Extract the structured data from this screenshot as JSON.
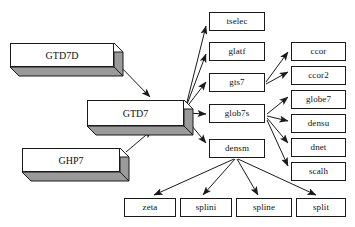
{
  "diagram": {
    "type": "flowchart",
    "background_color": "#ffffff",
    "box_fill_color": "#ffffff",
    "box_border_color": "#1a1a1a",
    "block_shade_color": "#9a9a9a",
    "arrow_color": "#1a1a1a"
  },
  "blocks": [
    {
      "id": "gtd7d",
      "label": "GTD7D",
      "x": 10,
      "y": 43,
      "w": 104,
      "h": 24,
      "depth": 9
    },
    {
      "id": "gtd7",
      "label": "GTD7",
      "x": 87,
      "y": 100,
      "w": 97,
      "h": 26,
      "depth": 9
    },
    {
      "id": "ghp7",
      "label": "GHP7",
      "x": 22,
      "y": 148,
      "w": 98,
      "h": 24,
      "depth": 9
    }
  ],
  "nodes": [
    {
      "id": "tselec",
      "label": "tselec",
      "x": 209,
      "y": 12,
      "w": 56,
      "h": 19
    },
    {
      "id": "glatf",
      "label": "glatf",
      "x": 209,
      "y": 42,
      "w": 56,
      "h": 19
    },
    {
      "id": "gts7",
      "label": "gts7",
      "x": 209,
      "y": 73,
      "w": 56,
      "h": 19
    },
    {
      "id": "glob7s",
      "label": "glob7s",
      "x": 209,
      "y": 104,
      "w": 56,
      "h": 19
    },
    {
      "id": "densm",
      "label": "densm",
      "x": 209,
      "y": 139,
      "w": 56,
      "h": 19
    },
    {
      "id": "ccor",
      "label": "ccor",
      "x": 291,
      "y": 42,
      "w": 55,
      "h": 19
    },
    {
      "id": "ccor2",
      "label": "ccor2",
      "x": 291,
      "y": 66,
      "w": 55,
      "h": 19
    },
    {
      "id": "globe7",
      "label": "globe7",
      "x": 291,
      "y": 90,
      "w": 55,
      "h": 19
    },
    {
      "id": "densu",
      "label": "densu",
      "x": 291,
      "y": 114,
      "w": 55,
      "h": 19
    },
    {
      "id": "dnet",
      "label": "dnet",
      "x": 291,
      "y": 138,
      "w": 55,
      "h": 19
    },
    {
      "id": "scalh",
      "label": "scalh",
      "x": 291,
      "y": 162,
      "w": 55,
      "h": 19
    },
    {
      "id": "zeta",
      "label": "zeta",
      "x": 124,
      "y": 198,
      "w": 52,
      "h": 19
    },
    {
      "id": "splini",
      "label": "splini",
      "x": 180,
      "y": 198,
      "w": 52,
      "h": 19
    },
    {
      "id": "spline",
      "label": "spline",
      "x": 236,
      "y": 198,
      "w": 56,
      "h": 19
    },
    {
      "id": "split",
      "label": "split",
      "x": 296,
      "y": 198,
      "w": 50,
      "h": 19
    }
  ],
  "edges": [
    {
      "from": "gtd7d",
      "to": "gtd7",
      "x1": 118,
      "y1": 64,
      "x2": 150,
      "y2": 97
    },
    {
      "from": "ghp7",
      "to": "gtd7",
      "x1": 126,
      "y1": 152,
      "x2": 152,
      "y2": 130
    },
    {
      "from": "gtd7",
      "to": "tselec",
      "x1": 186,
      "y1": 106,
      "x2": 206,
      "y2": 26
    },
    {
      "from": "gtd7",
      "to": "glatf",
      "x1": 186,
      "y1": 107,
      "x2": 206,
      "y2": 54
    },
    {
      "from": "gtd7",
      "to": "gts7",
      "x1": 186,
      "y1": 108,
      "x2": 206,
      "y2": 82
    },
    {
      "from": "gtd7",
      "to": "glob7s",
      "x1": 187,
      "y1": 113,
      "x2": 206,
      "y2": 114
    },
    {
      "from": "gtd7",
      "to": "densm",
      "x1": 187,
      "y1": 120,
      "x2": 206,
      "y2": 143
    },
    {
      "from": "gts7",
      "to": "ccor",
      "x1": 266,
      "y1": 82,
      "x2": 288,
      "y2": 52
    },
    {
      "from": "gts7",
      "to": "ccor2",
      "x1": 266,
      "y1": 84,
      "x2": 288,
      "y2": 72
    },
    {
      "from": "glob7s",
      "to": "globe7",
      "x1": 267,
      "y1": 114,
      "x2": 288,
      "y2": 97
    },
    {
      "from": "glob7s",
      "to": "densu",
      "x1": 267,
      "y1": 116,
      "x2": 288,
      "y2": 121
    },
    {
      "from": "glob7s",
      "to": "dnet",
      "x1": 267,
      "y1": 118,
      "x2": 288,
      "y2": 143
    },
    {
      "from": "glob7s",
      "to": "scalh",
      "x1": 267,
      "y1": 120,
      "x2": 288,
      "y2": 166
    },
    {
      "from": "densm",
      "to": "zeta",
      "x1": 234,
      "y1": 159,
      "x2": 154,
      "y2": 195
    },
    {
      "from": "densm",
      "to": "splini",
      "x1": 235,
      "y1": 159,
      "x2": 203,
      "y2": 195
    },
    {
      "from": "densm",
      "to": "spline",
      "x1": 237,
      "y1": 159,
      "x2": 258,
      "y2": 195
    },
    {
      "from": "densm",
      "to": "split",
      "x1": 238,
      "y1": 159,
      "x2": 316,
      "y2": 195
    }
  ]
}
